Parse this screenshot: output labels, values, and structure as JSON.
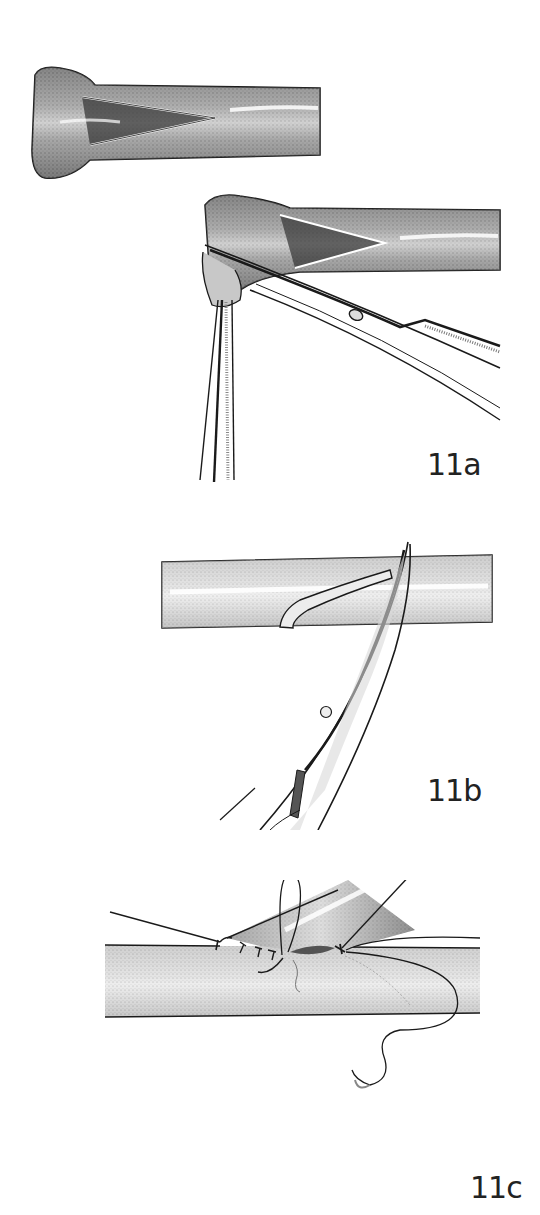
{
  "figure": {
    "panels": [
      {
        "id": "11a",
        "label": "11a",
        "description": "Vein end spatulated; cut extended with curved scissors while held with forceps"
      },
      {
        "id": "11b",
        "label": "11b",
        "description": "Longitudinal arteriotomy opened with curved scissors"
      },
      {
        "id": "11c",
        "label": "11c",
        "description": "End-to-side anastomosis sewn with running suture and needle"
      }
    ]
  },
  "colors": {
    "ink": "#1a1a1a",
    "stipple": "#8a8a8a",
    "highlight": "#f2f2f2",
    "background": "#ffffff"
  }
}
